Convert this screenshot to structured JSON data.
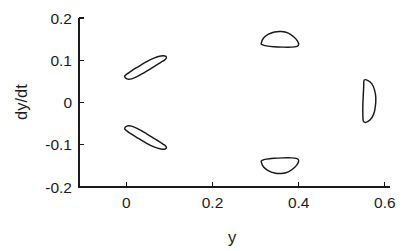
{
  "chart_data": {
    "type": "line",
    "title": "",
    "xlabel": "y",
    "ylabel": "dy/dt",
    "xlim": [
      -0.11,
      0.612
    ],
    "ylim": [
      -0.2,
      0.2
    ],
    "grid": false,
    "legend": null,
    "xticks": [
      0,
      0.2,
      0.4,
      0.6
    ],
    "xtick_labels": [
      "0",
      "0.2",
      "0.4",
      "0.6"
    ],
    "yticks": [
      -0.2,
      -0.1,
      0,
      0.1,
      0.2
    ],
    "ytick_labels": [
      "-0.2",
      "-0.1",
      "0",
      "0.1",
      "0.2"
    ],
    "series": [
      {
        "name": "orbit-upper-left",
        "description": "tilted thin ellipse, positive slope, upper left",
        "center": [
          0.043,
          0.086
        ],
        "points": [
          [
            -0.004,
            0.062
          ],
          [
            0.001,
            0.056
          ],
          [
            0.012,
            0.056
          ],
          [
            0.028,
            0.063
          ],
          [
            0.047,
            0.074
          ],
          [
            0.066,
            0.086
          ],
          [
            0.08,
            0.095
          ],
          [
            0.089,
            0.101
          ],
          [
            0.093,
            0.106
          ],
          [
            0.09,
            0.11
          ],
          [
            0.08,
            0.11
          ],
          [
            0.064,
            0.105
          ],
          [
            0.046,
            0.096
          ],
          [
            0.028,
            0.085
          ],
          [
            0.012,
            0.075
          ],
          [
            0.001,
            0.067
          ],
          [
            -0.004,
            0.062
          ]
        ]
      },
      {
        "name": "orbit-lower-left",
        "description": "tilted thin ellipse, negative slope, lower left",
        "center": [
          0.043,
          -0.086
        ],
        "points": [
          [
            -0.004,
            -0.062
          ],
          [
            0.001,
            -0.056
          ],
          [
            0.012,
            -0.056
          ],
          [
            0.028,
            -0.063
          ],
          [
            0.047,
            -0.074
          ],
          [
            0.066,
            -0.086
          ],
          [
            0.08,
            -0.095
          ],
          [
            0.089,
            -0.101
          ],
          [
            0.093,
            -0.106
          ],
          [
            0.09,
            -0.11
          ],
          [
            0.08,
            -0.11
          ],
          [
            0.064,
            -0.105
          ],
          [
            0.046,
            -0.096
          ],
          [
            0.028,
            -0.085
          ],
          [
            0.012,
            -0.075
          ],
          [
            0.001,
            -0.067
          ],
          [
            -0.004,
            -0.062
          ]
        ]
      },
      {
        "name": "orbit-upper-middle",
        "description": "dome shaped closed orbit, flat bottom, upper middle",
        "center": [
          0.357,
          0.148
        ],
        "points": [
          [
            0.313,
            0.14
          ],
          [
            0.318,
            0.152
          ],
          [
            0.329,
            0.161
          ],
          [
            0.344,
            0.167
          ],
          [
            0.36,
            0.168
          ],
          [
            0.376,
            0.164
          ],
          [
            0.389,
            0.155
          ],
          [
            0.397,
            0.146
          ],
          [
            0.4,
            0.138
          ],
          [
            0.396,
            0.133
          ],
          [
            0.383,
            0.131
          ],
          [
            0.363,
            0.131
          ],
          [
            0.342,
            0.132
          ],
          [
            0.325,
            0.134
          ],
          [
            0.315,
            0.137
          ],
          [
            0.313,
            0.14
          ]
        ]
      },
      {
        "name": "orbit-lower-middle",
        "description": "inverted dome closed orbit, flat top, lower middle",
        "center": [
          0.357,
          -0.148
        ],
        "points": [
          [
            0.313,
            -0.14
          ],
          [
            0.318,
            -0.152
          ],
          [
            0.329,
            -0.161
          ],
          [
            0.344,
            -0.167
          ],
          [
            0.36,
            -0.168
          ],
          [
            0.376,
            -0.164
          ],
          [
            0.389,
            -0.155
          ],
          [
            0.397,
            -0.146
          ],
          [
            0.4,
            -0.138
          ],
          [
            0.396,
            -0.133
          ],
          [
            0.383,
            -0.131
          ],
          [
            0.363,
            -0.131
          ],
          [
            0.342,
            -0.132
          ],
          [
            0.325,
            -0.134
          ],
          [
            0.315,
            -0.137
          ],
          [
            0.313,
            -0.14
          ]
        ]
      },
      {
        "name": "orbit-right-crescent",
        "description": "D-shaped half moon orbit, straight left edge, bulging right",
        "center": [
          0.565,
          0.003
        ],
        "points": [
          [
            0.552,
            0.053
          ],
          [
            0.561,
            0.052
          ],
          [
            0.57,
            0.044
          ],
          [
            0.576,
            0.03
          ],
          [
            0.579,
            0.012
          ],
          [
            0.578,
            -0.009
          ],
          [
            0.574,
            -0.028
          ],
          [
            0.566,
            -0.041
          ],
          [
            0.556,
            -0.047
          ],
          [
            0.55,
            -0.044
          ],
          [
            0.549,
            -0.028
          ],
          [
            0.549,
            -0.006
          ],
          [
            0.55,
            0.018
          ],
          [
            0.551,
            0.039
          ],
          [
            0.552,
            0.053
          ]
        ]
      }
    ]
  },
  "axes": {
    "x_axis_title": "y",
    "y_axis_title": "dy/dt"
  }
}
